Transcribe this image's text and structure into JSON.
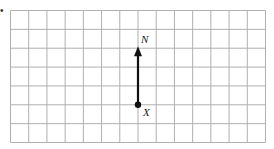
{
  "diagram": {
    "type": "grid-with-vector",
    "grid": {
      "columns": 14,
      "rows": 7,
      "line_color": "#b0b0b0"
    },
    "vector": {
      "start_label": "X",
      "end_label": "N",
      "start_cell": {
        "col": 7,
        "row": 5
      },
      "end_cell": {
        "col": 7,
        "row": 2
      },
      "color": "#111111"
    },
    "marker": "•"
  }
}
